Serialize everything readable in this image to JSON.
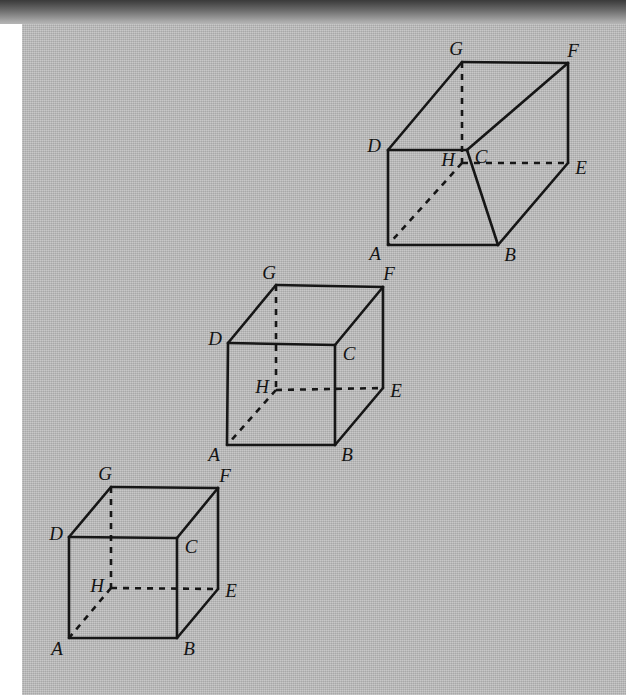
{
  "page": {
    "width": 626,
    "height": 695,
    "background_color": "#b9b9b9",
    "paper_left_margin_color": "#ffffff",
    "scan_shadow_band_color": "#3a3a3a",
    "ink_color": "#161616"
  },
  "figures": [
    {
      "id": "figure-top",
      "name": "rectangular-box-elongated",
      "shape": "rectangular prism (elongated box)",
      "vertices": [
        {
          "label": "A",
          "x": 388,
          "y": 245,
          "label_x": 375,
          "label_y": 253
        },
        {
          "label": "B",
          "x": 498,
          "y": 245,
          "label_x": 510,
          "label_y": 254
        },
        {
          "label": "C",
          "x": 467,
          "y": 150,
          "label_x": 481,
          "label_y": 156
        },
        {
          "label": "D",
          "x": 388,
          "y": 150,
          "label_x": 374,
          "label_y": 145
        },
        {
          "label": "E",
          "x": 568,
          "y": 163,
          "label_x": 581,
          "label_y": 167
        },
        {
          "label": "F",
          "x": 568,
          "y": 63,
          "label_x": 573,
          "label_y": 50
        },
        {
          "label": "G",
          "x": 462,
          "y": 62,
          "label_x": 456,
          "label_y": 48
        },
        {
          "label": "H",
          "x": 462,
          "y": 163,
          "label_x": 448,
          "label_y": 159
        }
      ],
      "solid_edges": [
        [
          "A",
          "B"
        ],
        [
          "A",
          "D"
        ],
        [
          "D",
          "C"
        ],
        [
          "C",
          "B"
        ],
        [
          "D",
          "G"
        ],
        [
          "G",
          "F"
        ],
        [
          "F",
          "E"
        ],
        [
          "E",
          "B"
        ],
        [
          "C",
          "F"
        ]
      ],
      "hidden_edges": [
        [
          "G",
          "H"
        ],
        [
          "H",
          "E"
        ],
        [
          "H",
          "A"
        ]
      ]
    },
    {
      "id": "figure-middle",
      "name": "cube-middle",
      "shape": "cube",
      "vertices": [
        {
          "label": "A",
          "x": 227,
          "y": 445,
          "label_x": 214,
          "label_y": 454
        },
        {
          "label": "B",
          "x": 335,
          "y": 445,
          "label_x": 347,
          "label_y": 454
        },
        {
          "label": "C",
          "x": 335,
          "y": 345,
          "label_x": 349,
          "label_y": 353
        },
        {
          "label": "D",
          "x": 228,
          "y": 343,
          "label_x": 215,
          "label_y": 338
        },
        {
          "label": "E",
          "x": 383,
          "y": 388,
          "label_x": 396,
          "label_y": 390
        },
        {
          "label": "F",
          "x": 383,
          "y": 287,
          "label_x": 389,
          "label_y": 273
        },
        {
          "label": "G",
          "x": 276,
          "y": 285,
          "label_x": 269,
          "label_y": 272
        },
        {
          "label": "H",
          "x": 276,
          "y": 390,
          "label_x": 262,
          "label_y": 386
        }
      ],
      "solid_edges": [
        [
          "A",
          "B"
        ],
        [
          "A",
          "D"
        ],
        [
          "D",
          "C"
        ],
        [
          "C",
          "B"
        ],
        [
          "D",
          "G"
        ],
        [
          "G",
          "F"
        ],
        [
          "F",
          "E"
        ],
        [
          "E",
          "B"
        ],
        [
          "C",
          "F"
        ]
      ],
      "hidden_edges": [
        [
          "G",
          "H"
        ],
        [
          "H",
          "E"
        ],
        [
          "H",
          "A"
        ]
      ]
    },
    {
      "id": "figure-bottom",
      "name": "cube-bottom",
      "shape": "cube",
      "vertices": [
        {
          "label": "A",
          "x": 69,
          "y": 638,
          "label_x": 57,
          "label_y": 648
        },
        {
          "label": "B",
          "x": 177,
          "y": 638,
          "label_x": 189,
          "label_y": 648
        },
        {
          "label": "C",
          "x": 177,
          "y": 538,
          "label_x": 191,
          "label_y": 546
        },
        {
          "label": "D",
          "x": 69,
          "y": 537,
          "label_x": 56,
          "label_y": 533
        },
        {
          "label": "E",
          "x": 218,
          "y": 589,
          "label_x": 231,
          "label_y": 590
        },
        {
          "label": "F",
          "x": 218,
          "y": 488,
          "label_x": 225,
          "label_y": 475
        },
        {
          "label": "G",
          "x": 111,
          "y": 487,
          "label_x": 105,
          "label_y": 473
        },
        {
          "label": "H",
          "x": 111,
          "y": 588,
          "label_x": 97,
          "label_y": 585
        }
      ],
      "solid_edges": [
        [
          "A",
          "B"
        ],
        [
          "A",
          "D"
        ],
        [
          "D",
          "C"
        ],
        [
          "C",
          "B"
        ],
        [
          "D",
          "G"
        ],
        [
          "G",
          "F"
        ],
        [
          "F",
          "E"
        ],
        [
          "E",
          "B"
        ],
        [
          "C",
          "F"
        ]
      ],
      "hidden_edges": [
        [
          "G",
          "H"
        ],
        [
          "H",
          "E"
        ],
        [
          "H",
          "A"
        ]
      ]
    }
  ]
}
